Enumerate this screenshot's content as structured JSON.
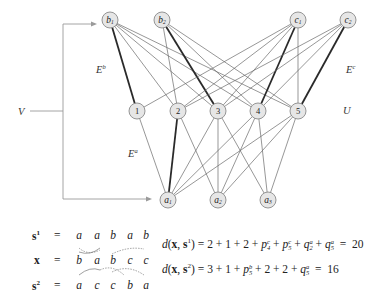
{
  "labels": {
    "V": "V",
    "U": "U",
    "Eb": {
      "base": "E",
      "sup": "b"
    },
    "Ec": {
      "base": "E",
      "sup": "c"
    },
    "Ea": {
      "base": "E",
      "sup": "a"
    }
  },
  "nodes": {
    "top": [
      {
        "id": "b1",
        "base": "b",
        "sub": "1"
      },
      {
        "id": "b2",
        "base": "b",
        "sub": "2"
      },
      {
        "id": "c1",
        "base": "c",
        "sub": "1"
      },
      {
        "id": "c2",
        "base": "c",
        "sub": "2"
      }
    ],
    "middle": [
      {
        "id": "u1",
        "label": "1"
      },
      {
        "id": "u2",
        "label": "2"
      },
      {
        "id": "u3",
        "label": "3"
      },
      {
        "id": "u4",
        "label": "4"
      },
      {
        "id": "u5",
        "label": "5"
      }
    ],
    "bottom": [
      {
        "id": "a1",
        "base": "a",
        "sub": "1"
      },
      {
        "id": "a2",
        "base": "a",
        "sub": "2"
      },
      {
        "id": "a3",
        "base": "a",
        "sub": "3"
      }
    ]
  },
  "edges": {
    "heavy": [
      "b1-u1",
      "b2-u3",
      "c1-u4",
      "c2-u5",
      "u2-a1"
    ],
    "note": "complete bipartite connections between V-layer nodes and U; heavy lines mark selected matching"
  },
  "sequences": {
    "s1": {
      "lhs": "s",
      "sup": "1",
      "eq": "=",
      "chars": [
        "a",
        "a",
        "b",
        "a",
        "b"
      ]
    },
    "x": {
      "lhs": "x",
      "sup": "",
      "eq": "=",
      "chars": [
        "b",
        "a",
        "b",
        "c",
        "c"
      ]
    },
    "s2": {
      "lhs": "s",
      "sup": "2",
      "eq": "=",
      "chars": [
        "a",
        "c",
        "c",
        "b",
        "a"
      ]
    }
  },
  "formulas": {
    "d1": {
      "lhs_func": "d",
      "lhs_args": "(x, s",
      "lhs_sup": "1",
      "rhs_terms": "= 2 + 1 + 2 + ",
      "p_terms": [
        {
          "base": "p",
          "sub": "4",
          "sup": "c"
        },
        {
          "base": "p",
          "sub": "5",
          "sup": "c"
        },
        {
          "base": "q",
          "sub": "2",
          "sup": "a"
        },
        {
          "base": "q",
          "sub": "5",
          "sup": "a"
        }
      ],
      "result": "20"
    },
    "d2": {
      "lhs_func": "d",
      "lhs_args": "(x, s",
      "lhs_sup": "2",
      "prefix": "= 3 + 1 + ",
      "term1": {
        "base": "p",
        "sub": "5",
        "sup": "b"
      },
      "middle": " + 2 + 2 + ",
      "term2": {
        "base": "q",
        "sub": "5",
        "sup": "a"
      },
      "result": "16"
    }
  }
}
